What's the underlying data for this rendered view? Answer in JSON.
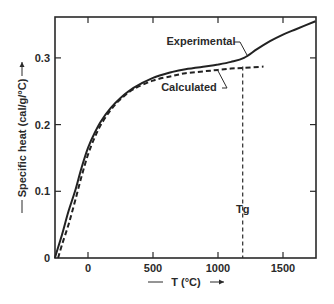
{
  "chart_data": {
    "type": "line",
    "title": "",
    "xlabel": "T (°C)",
    "ylabel": "Specific heat (cal/g/°C)",
    "xlim": [
      -255,
      1750
    ],
    "ylim": [
      0,
      0.36
    ],
    "x_ticks": [
      0,
      500,
      1000,
      1500
    ],
    "x_tick_labels": [
      "0",
      "500",
      "1000",
      "1500"
    ],
    "y_ticks": [
      0,
      0.1,
      0.2,
      0.3
    ],
    "y_tick_labels": [
      "0",
      "0.1",
      "0.2",
      "0.3"
    ],
    "grid": false,
    "legend": "inline annotations",
    "series": [
      {
        "name": "Experimental",
        "style": "solid",
        "x": [
          -255,
          -200,
          -150,
          -100,
          -50,
          0,
          50,
          100,
          175,
          250,
          350,
          500,
          650,
          750,
          900,
          1000,
          1100,
          1200,
          1300,
          1400,
          1500,
          1600,
          1750
        ],
        "y": [
          0,
          0.035,
          0.07,
          0.1,
          0.135,
          0.165,
          0.187,
          0.205,
          0.225,
          0.24,
          0.255,
          0.27,
          0.279,
          0.283,
          0.287,
          0.29,
          0.294,
          0.3,
          0.313,
          0.325,
          0.335,
          0.343,
          0.355
        ]
      },
      {
        "name": "Calculated",
        "style": "dashed",
        "x": [
          -230,
          -200,
          -150,
          -100,
          -50,
          0,
          50,
          100,
          175,
          250,
          350,
          500,
          650,
          750,
          900,
          1000,
          1100,
          1200,
          1350
        ],
        "y": [
          0,
          0.02,
          0.05,
          0.085,
          0.122,
          0.155,
          0.18,
          0.2,
          0.222,
          0.238,
          0.253,
          0.266,
          0.273,
          0.277,
          0.28,
          0.282,
          0.284,
          0.285,
          0.287
        ]
      }
    ],
    "annotations": [
      {
        "text": "Experimental",
        "points_to": {
          "x": 1200,
          "y": 0.3
        }
      },
      {
        "text": "Calculated",
        "points_to": {
          "x": 900,
          "y": 0.282
        }
      },
      {
        "text": "Tg",
        "type": "vertical-dashed-line",
        "x": 1190,
        "y_top": 0.287
      }
    ]
  },
  "labels": {
    "experimental": "Experimental",
    "calculated": "Calculated",
    "tg": "Tg",
    "xlabel": "T (°C)",
    "ylabel": "Specific heat (cal/g/°C)"
  }
}
